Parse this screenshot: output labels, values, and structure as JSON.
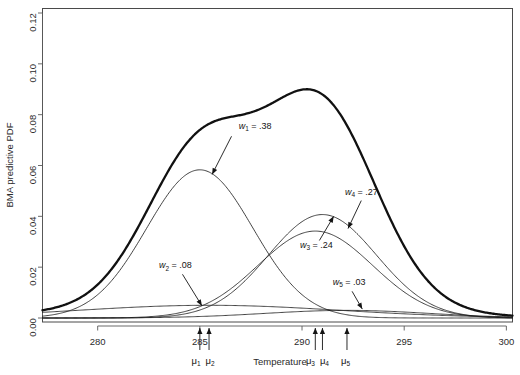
{
  "chart_data": {
    "type": "line",
    "title": "",
    "xlabel": "Temperature",
    "ylabel": "BMA predictive PDF",
    "xlim": [
      277.3,
      300.3
    ],
    "ylim": [
      0.0,
      0.12
    ],
    "xticks": [
      280,
      285,
      290,
      295,
      300
    ],
    "xtick_labels": [
      "280",
      "285",
      "290",
      "295",
      "300"
    ],
    "yticks": [
      0.0,
      0.02,
      0.04,
      0.06,
      0.08,
      0.1,
      0.12
    ],
    "ytick_labels": [
      "0.00",
      "0.02",
      "0.04",
      "0.06",
      "0.08",
      "0.10",
      "0.12"
    ],
    "grid": false,
    "legend": "none",
    "components": [
      {
        "name": "w1",
        "weight": 0.38,
        "mean": 285.0,
        "sd": 2.6,
        "peak": 0.0583,
        "label": "w",
        "sub": "1",
        "value_text": "= .38"
      },
      {
        "name": "w2",
        "weight": 0.08,
        "mean": 285.45,
        "sd": 6.4,
        "peak": 0.005,
        "label": "w",
        "sub": "2",
        "value_text": "= .08"
      },
      {
        "name": "w3",
        "weight": 0.24,
        "mean": 290.65,
        "sd": 2.8,
        "peak": 0.0342,
        "label": "w",
        "sub": "3",
        "value_text": "= .24"
      },
      {
        "name": "w4",
        "weight": 0.27,
        "mean": 291.0,
        "sd": 2.65,
        "peak": 0.0407,
        "label": "w",
        "sub": "4",
        "value_text": "= .27"
      },
      {
        "name": "w5",
        "weight": 0.03,
        "mean": 292.2,
        "sd": 4.0,
        "peak": 0.003,
        "label": "w",
        "sub": "5",
        "value_text": "= .03"
      }
    ],
    "bma_curve": {
      "name": "BMA predictive PDF",
      "plateau_value": 0.0805,
      "plateau_x": 286.5,
      "peak_value": 0.09,
      "peak_x": 290.9
    },
    "mu_markers": [
      {
        "label": "μ",
        "sub": "1",
        "x": 285.0
      },
      {
        "label": "μ",
        "sub": "2",
        "x": 285.45
      },
      {
        "label": "μ",
        "sub": "3",
        "x": 290.65
      },
      {
        "label": "μ",
        "sub": "4",
        "x": 291.0
      },
      {
        "label": "μ",
        "sub": "5",
        "x": 292.2
      }
    ],
    "annotations": [
      {
        "text_label": "w",
        "text_sub": "1",
        "text_value": "= .38",
        "x": 286.9,
        "y": 0.0745
      },
      {
        "text_label": "w",
        "text_sub": "2",
        "text_value": "= .08",
        "x": 283.0,
        "y": 0.0195
      },
      {
        "text_label": "w",
        "text_sub": "3",
        "text_value": "= .24",
        "x": 289.9,
        "y": 0.0275
      },
      {
        "text_label": "w",
        "text_sub": "4",
        "text_value": "= .27",
        "x": 292.1,
        "y": 0.0485
      },
      {
        "text_label": "w",
        "text_sub": "5",
        "text_value": "= .03",
        "x": 291.5,
        "y": 0.013
      }
    ]
  },
  "axes": {
    "ylabel": "BMA predictive PDF",
    "xlabel": "Temperature",
    "ytick_0": "0.00",
    "ytick_1": "0.02",
    "ytick_2": "0.04",
    "ytick_3": "0.06",
    "ytick_4": "0.08",
    "ytick_5": "0.10",
    "ytick_6": "0.12",
    "xtick_0": "280",
    "xtick_1": "285",
    "xtick_2": "290",
    "xtick_3": "295",
    "xtick_4": "300"
  },
  "labels": {
    "w1": "w",
    "w1s": "1",
    "w1v": "= .38",
    "w2": "w",
    "w2s": "2",
    "w2v": "= .08",
    "w3": "w",
    "w3s": "3",
    "w3v": "= .24",
    "w4": "w",
    "w4s": "4",
    "w4v": "= .27",
    "w5": "w",
    "w5s": "5",
    "w5v": "= .03",
    "mu": "μ",
    "mu1s": "1",
    "mu2s": "2",
    "mu3s": "3",
    "mu4s": "4",
    "mu5s": "5"
  }
}
